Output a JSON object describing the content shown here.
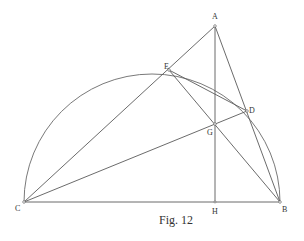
{
  "figure": {
    "caption": "Fig. 12",
    "points": {
      "A": {
        "label": "A",
        "x": 215,
        "y": 26
      },
      "B": {
        "label": "B",
        "x": 280,
        "y": 202
      },
      "C": {
        "label": "C",
        "x": 24,
        "y": 202
      },
      "D": {
        "label": "D",
        "x": 247,
        "y": 111
      },
      "E": {
        "label": "E",
        "x": 169,
        "y": 70
      },
      "G": {
        "label": "G",
        "x": 215,
        "y": 124
      },
      "H": {
        "label": "H",
        "x": 215,
        "y": 202
      }
    },
    "segments": [
      "CA",
      "AB",
      "AH",
      "CB",
      "CD",
      "EB",
      "ED",
      "CE"
    ],
    "semicircle": {
      "center_x": 152,
      "center_y": 202,
      "radius": 128,
      "diameter": "CB"
    },
    "colors": {
      "line": "#5a5a5a",
      "background": "#ffffff",
      "text": "#333333"
    }
  }
}
